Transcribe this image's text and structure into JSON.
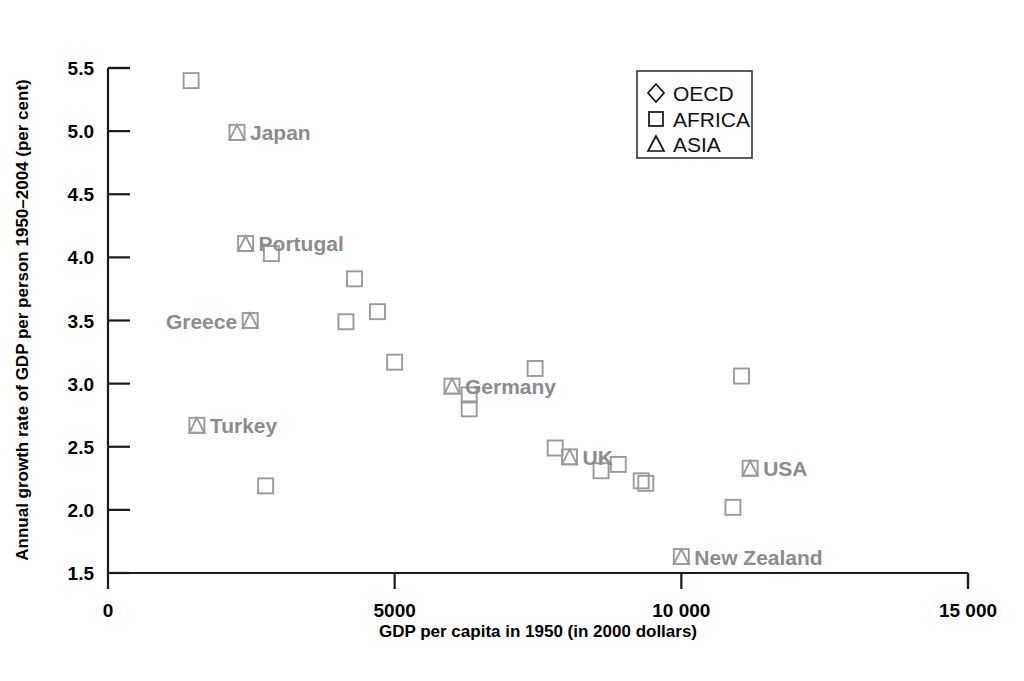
{
  "chart_data": {
    "type": "scatter",
    "title": "",
    "xlabel": "GDP per capita in 1950 (in 2000 dollars)",
    "ylabel": "Annual growth rate of GDP per person 1950–2004  (per cent)",
    "xlim": [
      0,
      15000
    ],
    "ylim": [
      1.5,
      5.5
    ],
    "grid": false,
    "xticks": [
      0,
      5000,
      10000,
      15000
    ],
    "xticklabels": [
      "0",
      "5000",
      "10 000",
      "15 000"
    ],
    "yticks": [
      1.5,
      2.0,
      2.5,
      3.0,
      3.5,
      4.0,
      4.5,
      5.0,
      5.5
    ],
    "yticklabels": [
      "1.5",
      "2.0",
      "2.5",
      "3.0",
      "3.5",
      "4.0",
      "4.5",
      "5.0",
      "5.5"
    ],
    "legend": {
      "position": "top-right",
      "entries": [
        {
          "label": "OECD",
          "marker": "diamond"
        },
        {
          "label": "AFRICA",
          "marker": "square"
        },
        {
          "label": "ASIA",
          "marker": "triangle"
        }
      ]
    },
    "marker_color": "#9a9a9a",
    "label_color": "#8c8c8c",
    "axis_color": "#1a1a1a",
    "points": [
      {
        "x": 1450,
        "y": 5.4,
        "marker": "square",
        "label": ""
      },
      {
        "x": 2250,
        "y": 4.99,
        "marker": "square+triangle",
        "label": "Japan",
        "label_side": "right"
      },
      {
        "x": 2400,
        "y": 4.11,
        "marker": "square+triangle",
        "label": "Portugal",
        "label_side": "right"
      },
      {
        "x": 2850,
        "y": 4.03,
        "marker": "square",
        "label": ""
      },
      {
        "x": 4300,
        "y": 3.83,
        "marker": "square",
        "label": ""
      },
      {
        "x": 4700,
        "y": 3.57,
        "marker": "square",
        "label": ""
      },
      {
        "x": 4150,
        "y": 3.49,
        "marker": "square",
        "label": ""
      },
      {
        "x": 2480,
        "y": 3.5,
        "marker": "square+triangle",
        "label": "Greece",
        "label_side": "left"
      },
      {
        "x": 5000,
        "y": 3.17,
        "marker": "square",
        "label": ""
      },
      {
        "x": 7450,
        "y": 3.12,
        "marker": "square",
        "label": ""
      },
      {
        "x": 11050,
        "y": 3.06,
        "marker": "square",
        "label": ""
      },
      {
        "x": 6000,
        "y": 2.98,
        "marker": "square+triangle",
        "label": "Germany",
        "label_side": "right"
      },
      {
        "x": 6300,
        "y": 2.91,
        "marker": "square",
        "label": ""
      },
      {
        "x": 6300,
        "y": 2.8,
        "marker": "square",
        "label": ""
      },
      {
        "x": 1550,
        "y": 2.67,
        "marker": "square+triangle",
        "label": "Turkey",
        "label_side": "right"
      },
      {
        "x": 7800,
        "y": 2.49,
        "marker": "square",
        "label": ""
      },
      {
        "x": 8050,
        "y": 2.42,
        "marker": "square+triangle",
        "label": "UK",
        "label_side": "right"
      },
      {
        "x": 11200,
        "y": 2.33,
        "marker": "square+triangle",
        "label": "USA",
        "label_side": "right"
      },
      {
        "x": 8600,
        "y": 2.31,
        "marker": "square",
        "label": ""
      },
      {
        "x": 8900,
        "y": 2.36,
        "marker": "square",
        "label": ""
      },
      {
        "x": 9300,
        "y": 2.23,
        "marker": "square",
        "label": ""
      },
      {
        "x": 9380,
        "y": 2.21,
        "marker": "square",
        "label": ""
      },
      {
        "x": 2750,
        "y": 2.19,
        "marker": "square",
        "label": ""
      },
      {
        "x": 10900,
        "y": 2.02,
        "marker": "square",
        "label": ""
      },
      {
        "x": 10000,
        "y": 1.63,
        "marker": "square+triangle",
        "label": "New Zealand",
        "label_side": "right"
      }
    ]
  }
}
